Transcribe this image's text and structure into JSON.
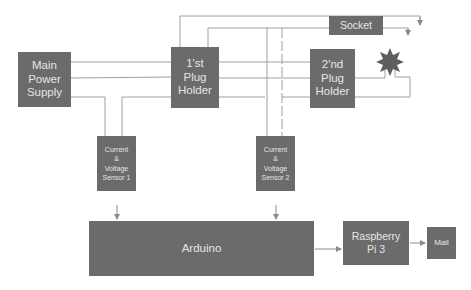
{
  "diagram": {
    "blocks": {
      "main_power_supply": "Main\nPower\nSupply",
      "plug_holder_1": "1'st\nPlug\nHolder",
      "plug_holder_2": "2'nd\nPlug\nHolder",
      "socket": "Socket",
      "sensor_1": "Current\n&\nVoltage\nSensor 1",
      "sensor_2": "Current\n&\nVoltage\nSensor 2",
      "arduino": "Arduino",
      "raspberry_pi": "Raspberry\nPi 3",
      "mail": "Mail"
    },
    "load_symbol": "bulb-burst-icon",
    "colors": {
      "block_fill": "#6b6b6b",
      "block_text": "#e6e6e6",
      "wire": "#9a9a9a"
    }
  }
}
